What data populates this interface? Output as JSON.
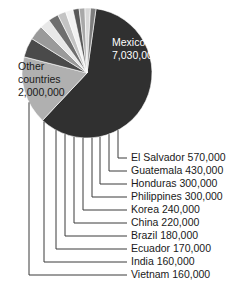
{
  "chart_data": {
    "type": "pie",
    "title": "",
    "unit": "people",
    "total": 11320000,
    "center": {
      "x": 87,
      "y": 73,
      "r": 65
    },
    "categories": [
      "Mexico",
      "Other countries",
      "El Salvador",
      "Guatemala",
      "Honduras",
      "Philippines",
      "Korea",
      "China",
      "Brazil",
      "Ecuador",
      "India",
      "Vietnam"
    ],
    "values": [
      7030000,
      2000000,
      570000,
      430000,
      300000,
      300000,
      240000,
      220000,
      180000,
      170000,
      160000,
      160000
    ],
    "slices": [
      {
        "name": "Mexico",
        "value": 7030000,
        "value_text": "7,030,000",
        "label": "Mexico",
        "color": "#303030",
        "label_color": "#ffffff",
        "label_pos": "inside"
      },
      {
        "name": "Other countries",
        "value": 2000000,
        "value_text": "2,000,000",
        "label": "Other countries",
        "color": "#b0b0b0",
        "label_color": "#1a1a1a",
        "label_pos": "inside"
      },
      {
        "name": "El Salvador",
        "value": 570000,
        "value_text": "570,000",
        "label": "El Salvador 570,000",
        "color": "#4a4a4a",
        "label_color": "#1a1a1a",
        "label_pos": "leader"
      },
      {
        "name": "Guatemala",
        "value": 430000,
        "value_text": "430,000",
        "label": "Guatemala 430,000",
        "color": "#9a9a9a",
        "label_color": "#1a1a1a",
        "label_pos": "leader"
      },
      {
        "name": "Honduras",
        "value": 300000,
        "value_text": "300,000",
        "label": "Honduras 300,000",
        "color": "#e8e8e8",
        "label_color": "#1a1a1a",
        "label_pos": "leader"
      },
      {
        "name": "Philippines",
        "value": 300000,
        "value_text": "300,000",
        "label": "Philippines 300,000",
        "color": "#6f6f6f",
        "label_color": "#1a1a1a",
        "label_pos": "leader"
      },
      {
        "name": "Korea",
        "value": 240000,
        "value_text": "240,000",
        "label": "Korea 240,000",
        "color": "#c4c4c4",
        "label_color": "#1a1a1a",
        "label_pos": "leader"
      },
      {
        "name": "China",
        "value": 220000,
        "value_text": "220,000",
        "label": "China 220,000",
        "color": "#f2f2f2",
        "label_color": "#1a1a1a",
        "label_pos": "leader"
      },
      {
        "name": "Brazil",
        "value": 180000,
        "value_text": "180,000",
        "label": "Brazil 180,000",
        "color": "#585858",
        "label_color": "#1a1a1a",
        "label_pos": "leader"
      },
      {
        "name": "Ecuador",
        "value": 170000,
        "value_text": "170,000",
        "label": "Ecuador 170,000",
        "color": "#a8a8a8",
        "label_color": "#1a1a1a",
        "label_pos": "leader"
      },
      {
        "name": "India",
        "value": 160000,
        "value_text": "160,000",
        "label": "India 160,000",
        "color": "#d8d8d8",
        "label_color": "#1a1a1a",
        "label_pos": "leader"
      },
      {
        "name": "Vietnam",
        "value": 160000,
        "value_text": "160,000",
        "label": "Vietnam 160,000",
        "color": "#7e7e7e",
        "label_color": "#1a1a1a",
        "label_pos": "leader"
      }
    ],
    "inside_labels": [
      {
        "name": "Mexico",
        "line1": "Mexico",
        "line2": "7,030,000",
        "x": 112,
        "y": 46,
        "color": "#ffffff"
      },
      {
        "name": "Other countries",
        "line1": "Other",
        "line2": "countries",
        "line3": "2,000,000",
        "x": 18,
        "y": 70,
        "color": "#1a1a1a"
      }
    ],
    "leader_labels": [
      {
        "name": "El Salvador",
        "text": "El Salvador 570,000",
        "y": 161,
        "drop_x": 118,
        "text_x": 131
      },
      {
        "name": "Guatemala",
        "text": "Guatemala 430,000",
        "y": 174,
        "drop_x": 109,
        "text_x": 131
      },
      {
        "name": "Honduras",
        "text": "Honduras 300,000",
        "y": 187,
        "drop_x": 100,
        "text_x": 131
      },
      {
        "name": "Philippines",
        "text": "Philippines 300,000",
        "y": 200,
        "drop_x": 92,
        "text_x": 131
      },
      {
        "name": "Korea",
        "text": "Korea 240,000",
        "y": 213,
        "drop_x": 83,
        "text_x": 131
      },
      {
        "name": "China",
        "text": "China 220,000",
        "y": 226,
        "drop_x": 74,
        "text_x": 131
      },
      {
        "name": "Brazil",
        "text": "Brazil 180,000",
        "y": 239,
        "drop_x": 65,
        "text_x": 131
      },
      {
        "name": "Ecuador",
        "text": "Ecuador 170,000",
        "y": 252,
        "drop_x": 56,
        "text_x": 131
      },
      {
        "name": "India",
        "text": "India 160,000",
        "y": 265,
        "drop_x": 44,
        "text_x": 131
      },
      {
        "name": "Vietnam",
        "text": "Vietnam 160,000",
        "y": 278,
        "drop_x": 29,
        "text_x": 131
      }
    ],
    "background": "#ffffff",
    "legend": "leader-lines",
    "grid": false
  }
}
